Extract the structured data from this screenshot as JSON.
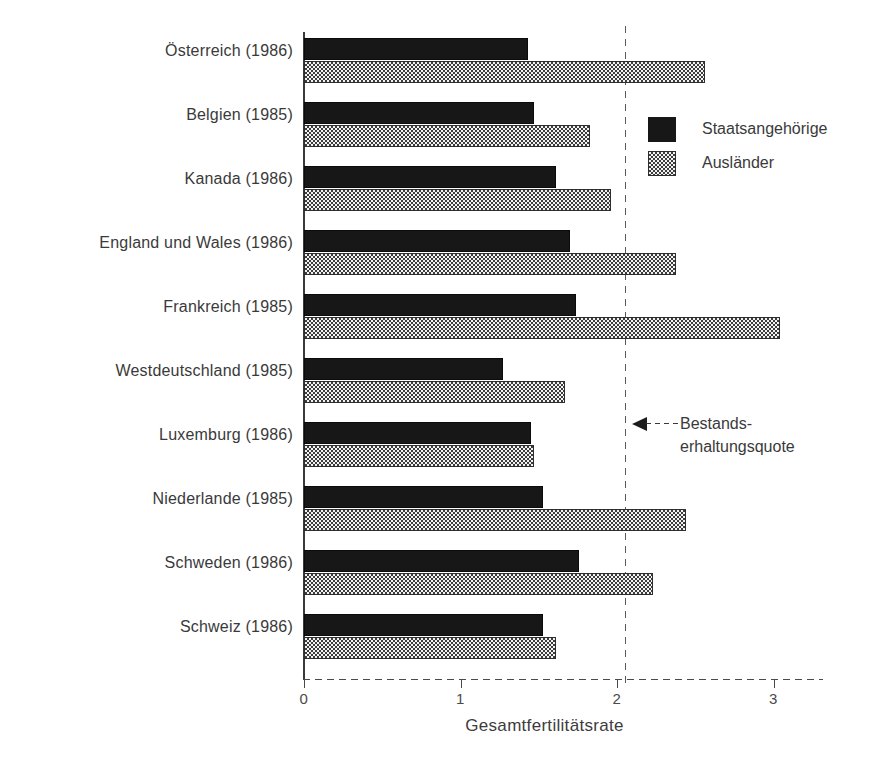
{
  "chart_data": {
    "type": "bar",
    "orientation": "horizontal",
    "title": "",
    "xlabel": "Gesamtfertilitätsrate",
    "ylabel": "",
    "xlim": [
      0,
      3.35
    ],
    "xticks": [
      0,
      1,
      2,
      3
    ],
    "xtick_labels": [
      "0",
      "1",
      "2",
      "3"
    ],
    "grid": false,
    "legend_position": "upper right",
    "categories": [
      "Österreich (1986)",
      "Belgien (1985)",
      "Kanada (1986)",
      "England und Wales (1986)",
      "Frankreich (1985)",
      "Westdeutschland (1985)",
      "Luxemburg (1986)",
      "Niederlande (1985)",
      "Schweden (1986)",
      "Schweiz (1986)"
    ],
    "series": [
      {
        "name": "Staatsangehörige",
        "values": [
          1.43,
          1.47,
          1.61,
          1.7,
          1.74,
          1.27,
          1.45,
          1.53,
          1.76,
          1.53
        ]
      },
      {
        "name": "Ausländer",
        "values": [
          2.56,
          1.83,
          1.96,
          2.38,
          3.04,
          1.67,
          1.47,
          2.44,
          2.23,
          1.61
        ]
      }
    ],
    "reference_line": {
      "value": 2.05,
      "label_line1": "Bestands-",
      "label_line2": "erhaltungsquote",
      "style": "dashed"
    },
    "colors": {
      "series_1": "#171717",
      "series_2": "#3d3d3d",
      "axis": "#3a3a3a",
      "reference_line": "#5a5a5a",
      "background": "#ffffff"
    }
  },
  "legend": {
    "entries": [
      {
        "label": "Staatsangehörige",
        "swatch": "solid-dark"
      },
      {
        "label": "Ausländer",
        "swatch": "checker-gray"
      }
    ]
  },
  "annotation": {
    "line1": "Bestands-",
    "line2": "erhaltungsquote",
    "arrow": "arrow-left-icon"
  },
  "axis": {
    "x_title": "Gesamtfertilitätsrate",
    "tick_labels": [
      "0",
      "1",
      "2",
      "3"
    ]
  }
}
